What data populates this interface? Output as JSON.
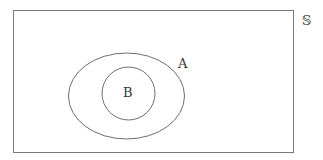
{
  "diagram": {
    "type": "venn",
    "universe": {
      "label": "𝕊"
    },
    "sets": [
      {
        "id": "A",
        "label": "A",
        "contains": [
          "B"
        ]
      },
      {
        "id": "B",
        "label": "B",
        "subset_of": "A"
      }
    ],
    "colors": {
      "stroke": "#6e6e6e",
      "text": "#333333",
      "background": "#ffffff"
    }
  }
}
